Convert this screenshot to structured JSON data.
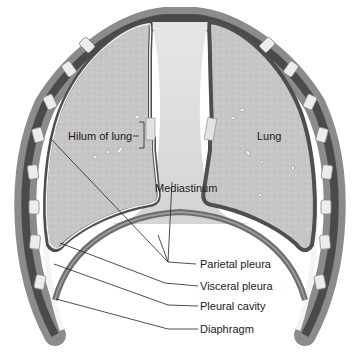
{
  "diagram": {
    "labels": {
      "hilum": "Hilum of lung",
      "lung": "Lung",
      "mediastinum": "Mediastinum",
      "parietal": "Parietal pleura",
      "visceral": "Visceral pleura",
      "cavity": "Pleural cavity",
      "diaphragm": "Diaphragm"
    },
    "colors": {
      "lung_fill": "#c4c4c4",
      "pleura_dark": "#555555",
      "pleura_light": "#f2f2f2",
      "mediastinum": "#dcdcdc",
      "rib": "#e8e8e8",
      "muscle": "#6a6a6a",
      "leader_line": "#222222"
    }
  }
}
